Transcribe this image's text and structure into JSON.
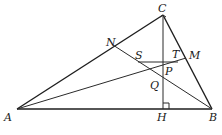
{
  "diagram": {
    "type": "geometry-figure",
    "points": {
      "A": "A",
      "B": "B",
      "C": "C",
      "H": "H",
      "N": "N",
      "M": "M",
      "S": "S",
      "T": "T",
      "P": "P",
      "Q": "Q"
    },
    "segments": [
      "AB",
      "BC",
      "CA",
      "CH",
      "AM",
      "BN",
      "ST"
    ],
    "right_angle_at": "H",
    "line_color": "#2a2a2a"
  }
}
